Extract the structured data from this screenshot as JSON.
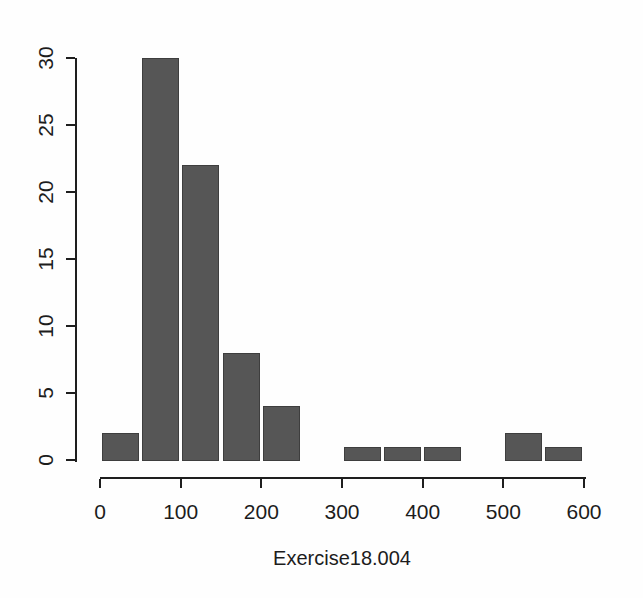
{
  "chart_data": {
    "type": "bar",
    "subtype": "histogram",
    "title": "",
    "xlabel": "Exercise18.004",
    "ylabel": "",
    "breaks": [
      0,
      50,
      100,
      150,
      200,
      250,
      300,
      350,
      400,
      450,
      500,
      550,
      600
    ],
    "counts": [
      2,
      30,
      22,
      8,
      4,
      0,
      1,
      1,
      1,
      0,
      2,
      1
    ],
    "x_ticks": [
      0,
      100,
      200,
      300,
      400,
      500,
      600
    ],
    "y_ticks": [
      0,
      5,
      10,
      15,
      20,
      25,
      30
    ],
    "xlim": [
      0,
      600
    ],
    "ylim": [
      0,
      30
    ],
    "grid": false,
    "legend": "none",
    "bar_color": "#565656",
    "bar_border_color": "#3e3e3e",
    "axis_color": "#1e1e1e",
    "text_color": "#1c1c1c",
    "background_color": "#fefefe"
  }
}
